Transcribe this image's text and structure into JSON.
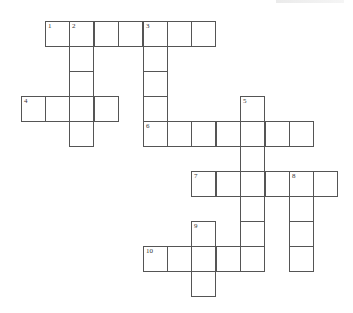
{
  "puzzle": {
    "type": "crossword",
    "origin": {
      "x": 45,
      "y": 21
    },
    "cell_width": 24.4,
    "cell_height": 25,
    "border_color": "#555555",
    "number_color": "#333333",
    "entries": [
      {
        "number": "1",
        "direction": "across",
        "row": 0,
        "col": 0,
        "length": 7
      },
      {
        "number": "2",
        "direction": "down",
        "row": 0,
        "col": 1,
        "length": 5
      },
      {
        "number": "3",
        "direction": "down",
        "row": 0,
        "col": 4,
        "length": 5
      },
      {
        "number": "4",
        "direction": "across",
        "row": 3,
        "col": -1,
        "length": 4
      },
      {
        "number": "5",
        "direction": "down",
        "row": 3,
        "col": 8,
        "length": 7
      },
      {
        "number": "6",
        "direction": "across",
        "row": 4,
        "col": 4,
        "length": 7
      },
      {
        "number": "7",
        "direction": "across",
        "row": 6,
        "col": 6,
        "length": 6
      },
      {
        "number": "8",
        "direction": "down",
        "row": 6,
        "col": 10,
        "length": 4
      },
      {
        "number": "9",
        "direction": "down",
        "row": 8,
        "col": 6,
        "length": 3
      },
      {
        "number": "10",
        "direction": "across",
        "row": 9,
        "col": 4,
        "length": 5
      }
    ]
  }
}
